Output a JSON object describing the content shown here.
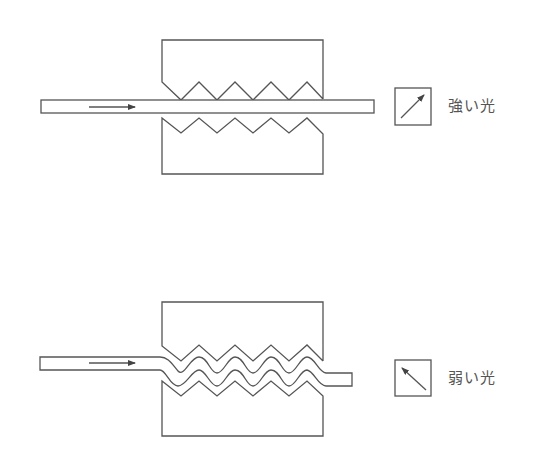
{
  "figure": {
    "colors": {
      "line": "#555555",
      "background": "#ffffff"
    },
    "panels": [
      {
        "id": "top",
        "state": "no pressure - fiber straight",
        "meter_icon": "meter-arrow-up-right-icon",
        "label": "強い光"
      },
      {
        "id": "bottom",
        "state": "pressure applied - fiber microbent between toothed dies",
        "meter_icon": "meter-arrow-up-left-icon",
        "label": "弱い光"
      }
    ]
  }
}
